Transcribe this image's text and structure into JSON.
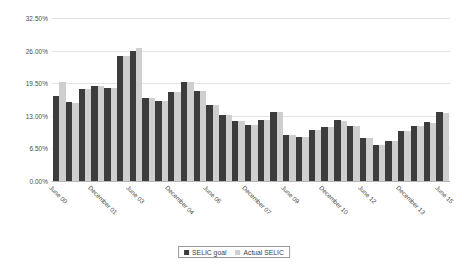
{
  "chart_data": {
    "type": "bar",
    "title": "",
    "subtitle": "",
    "xlabel": "",
    "ylabel": "",
    "ylim": [
      0,
      32.5
    ],
    "grid": true,
    "legend_position": "bottom",
    "y_ticks": [
      "0.00%",
      "6.50%",
      "13.00%",
      "19.50%",
      "26.00%",
      "32.50%"
    ],
    "y_tick_values": [
      0,
      6.5,
      13,
      19.5,
      26,
      32.5
    ],
    "categories": [
      "June 00",
      "December 00",
      "June 01",
      "December 01",
      "June 02",
      "December 02",
      "June 03",
      "December 03",
      "June 04",
      "December 04",
      "June 05",
      "December 05",
      "June 06",
      "December 06",
      "June 07",
      "December 07",
      "June 08",
      "December 08",
      "June 09",
      "December 09",
      "June 10",
      "December 10",
      "June 11",
      "December 11",
      "June 12",
      "December 12",
      "June 13",
      "December 13",
      "June 14",
      "December 14",
      "June 15"
    ],
    "x_tick_labels": [
      "June 00",
      "December 01",
      "June 03",
      "December 04",
      "June 06",
      "December 07",
      "June 09",
      "December 10",
      "June 12",
      "December 13",
      "June 15"
    ],
    "x_tick_indices": [
      0,
      3,
      6,
      9,
      12,
      15,
      18,
      21,
      24,
      27,
      30
    ],
    "series": [
      {
        "name": "SELIC goal",
        "color": "#3c3c3c",
        "values": [
          17.0,
          15.75,
          18.25,
          19.0,
          18.5,
          25.0,
          26.0,
          16.5,
          16.0,
          17.75,
          19.75,
          18.0,
          15.25,
          13.25,
          12.0,
          11.25,
          12.25,
          13.75,
          9.25,
          8.75,
          10.25,
          10.75,
          12.25,
          11.0,
          8.5,
          7.25,
          8.0,
          10.0,
          11.0,
          11.75,
          13.75
        ]
      },
      {
        "name": "Actual SELIC",
        "color": "#cfcfcf",
        "values": [
          19.75,
          15.5,
          18.25,
          19.0,
          18.5,
          25.0,
          26.5,
          16.5,
          16.0,
          17.75,
          19.75,
          18.0,
          15.25,
          13.25,
          12.0,
          11.25,
          12.25,
          13.75,
          9.25,
          8.75,
          10.25,
          10.75,
          12.0,
          11.0,
          8.5,
          7.25,
          8.0,
          9.9,
          11.0,
          11.65,
          13.65
        ]
      }
    ],
    "legend": [
      {
        "label": "SELIC goal",
        "swatch": "goal"
      },
      {
        "label": "Actual SELIC",
        "swatch": "actual"
      }
    ]
  }
}
